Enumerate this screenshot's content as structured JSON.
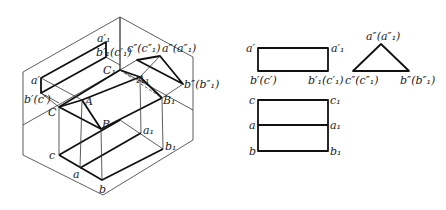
{
  "figure": {
    "isometric": {
      "labels": {
        "a1_prime": "a′₁",
        "b1c1_prime": "b′₁(c′₁)",
        "c_dd_c1_dd": "c″(c″₁)",
        "a_dd_a1_dd": "a″(a″₁)",
        "C1": "C₁",
        "A1": "A₁",
        "b_dd_b1_dd": "b″(b″₁)",
        "B1": "B₁",
        "a_prime": "a′",
        "b_prime_c_prime": "b′(c′)",
        "C": "C",
        "A": "A",
        "B": "B",
        "a1": "a₁",
        "b1": "b₁",
        "c": "c",
        "a": "a",
        "b": "b"
      }
    },
    "front_view": {
      "labels": {
        "top_left": "a′",
        "top_right": "a′₁",
        "bottom_left": "b′(c′)",
        "bottom_right": "b′₁(c′₁)"
      }
    },
    "side_view": {
      "labels": {
        "apex": "a″(a″₁)",
        "left": "c″(c″₁)",
        "right": "b″(b″₁)"
      }
    },
    "top_view": {
      "labels": {
        "c": "c",
        "c1": "c₁",
        "a": "a",
        "a1": "a₁",
        "b": "b",
        "b1": "b₁"
      }
    }
  }
}
